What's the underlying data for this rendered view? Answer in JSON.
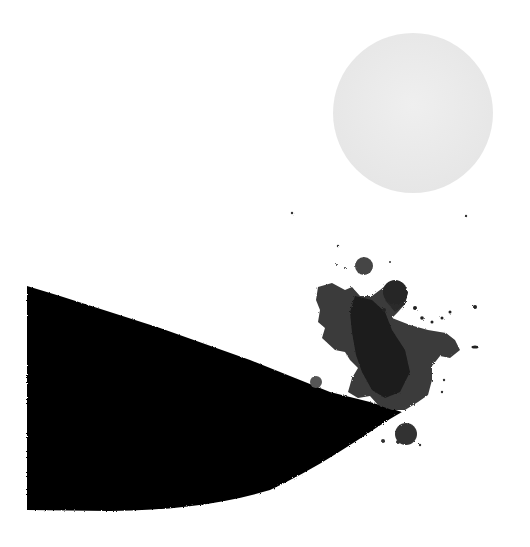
{
  "artwork": {
    "type": "abstract ink painting",
    "background_color": "#ffffff",
    "elements": {
      "circle": {
        "label": "pale moon circle",
        "cx": 413,
        "cy": 113,
        "r": 80,
        "color": "#ececec"
      },
      "wedge": {
        "label": "black ink wedge",
        "color": "#050505"
      },
      "splash": {
        "label": "ink splash",
        "color_dark": "#1a1a1a",
        "color_mid": "#3a3a3a",
        "color_light": "#555555"
      }
    }
  }
}
